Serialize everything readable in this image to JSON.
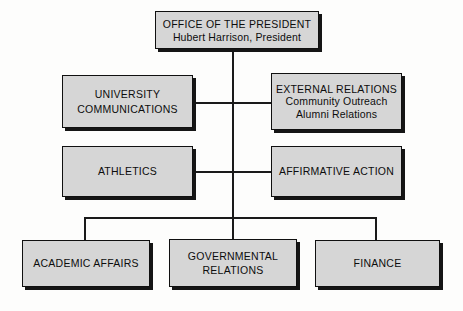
{
  "chart": {
    "type": "org-chart",
    "nodes": [
      {
        "id": "president",
        "lines": [
          "OFFICE OF THE PRESIDENT",
          "Hubert Harrison, President"
        ],
        "level": 0
      },
      {
        "id": "university-communications",
        "lines": [
          "UNIVERSITY",
          "COMMUNICATIONS"
        ],
        "level": 1
      },
      {
        "id": "external-relations",
        "lines": [
          "EXTERNAL RELATIONS",
          "Community Outreach",
          "Alumni Relations"
        ],
        "level": 1
      },
      {
        "id": "athletics",
        "lines": [
          "ATHLETICS"
        ],
        "level": 1
      },
      {
        "id": "affirmative-action",
        "lines": [
          "AFFIRMATIVE ACTION"
        ],
        "level": 1
      },
      {
        "id": "academic-affairs",
        "lines": [
          "ACADEMIC AFFAIRS"
        ],
        "level": 2
      },
      {
        "id": "governmental-relations",
        "lines": [
          "GOVERNMENTAL",
          "RELATIONS"
        ],
        "level": 2
      },
      {
        "id": "finance",
        "lines": [
          "FINANCE"
        ],
        "level": 2
      }
    ]
  },
  "president": {
    "line1": "OFFICE OF THE PRESIDENT",
    "line2": "Hubert Harrison, President"
  },
  "university_communications": {
    "line1": "UNIVERSITY",
    "line2": "COMMUNICATIONS"
  },
  "external_relations": {
    "line1": "EXTERNAL RELATIONS",
    "line2": "Community Outreach",
    "line3": "Alumni Relations"
  },
  "athletics": {
    "line1": "ATHLETICS"
  },
  "affirmative_action": {
    "line1": "AFFIRMATIVE ACTION"
  },
  "academic_affairs": {
    "line1": "ACADEMIC AFFAIRS"
  },
  "governmental_relations": {
    "line1": "GOVERNMENTAL",
    "line2": "RELATIONS"
  },
  "finance": {
    "line1": "FINANCE"
  },
  "colors": {
    "box_fill": "#d6d6d6",
    "box_border": "#101010",
    "shadow": "#151515",
    "line": "#1a1a1a",
    "background": "#fdfdfc",
    "text": "#0d0d0d"
  }
}
